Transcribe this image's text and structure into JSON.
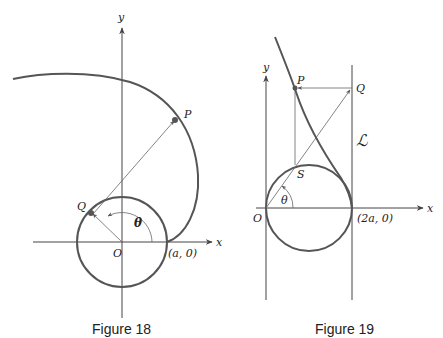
{
  "figure18": {
    "caption": "Figure 18",
    "labels": {
      "x_axis": "x",
      "y_axis": "y",
      "origin": "O",
      "point_p": "P",
      "point_q": "Q",
      "angle": "θ",
      "intercept": "(a, 0)"
    }
  },
  "figure19": {
    "caption": "Figure 19",
    "labels": {
      "x_axis": "x",
      "y_axis": "y",
      "origin": "O",
      "point_p": "P",
      "point_q": "Q",
      "point_s": "S",
      "angle": "θ",
      "intercept": "(2a, 0)",
      "line": "ℒ"
    }
  },
  "colors": {
    "curve": "#555555",
    "axis": "#444444",
    "text": "#222222"
  }
}
